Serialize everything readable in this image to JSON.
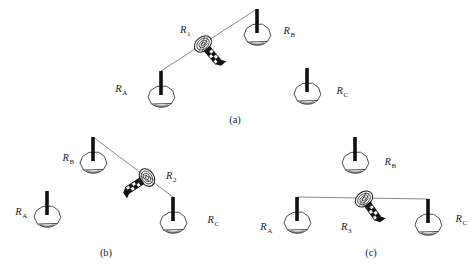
{
  "figure": {
    "background": "#ffffff",
    "link_color": "#6a6a6a",
    "ink_color": "#1a1a1a",
    "panels": [
      {
        "caption": "(a)",
        "relay_label": {
          "base": "R",
          "sub": "1"
        },
        "node_labels": {
          "a": {
            "base": "R",
            "sub": "A"
          },
          "b": {
            "base": "R",
            "sub": "B"
          },
          "c": {
            "base": "R",
            "sub": "C"
          }
        },
        "link": "RA connected to RB through relay R1; RC idle"
      },
      {
        "caption": "(b)",
        "relay_label": {
          "base": "R",
          "sub": "2"
        },
        "node_labels": {
          "a": {
            "base": "R",
            "sub": "A"
          },
          "b": {
            "base": "R",
            "sub": "B"
          },
          "c": {
            "base": "R",
            "sub": "C"
          }
        },
        "link": "RB connected to RC through relay R2; RA idle"
      },
      {
        "caption": "(c)",
        "relay_label": {
          "base": "R",
          "sub": "3"
        },
        "node_labels": {
          "a": {
            "base": "R",
            "sub": "A"
          },
          "b": {
            "base": "R",
            "sub": "B"
          },
          "c": {
            "base": "R",
            "sub": "C"
          }
        },
        "link": "RA connected to RC through relay R3; RB idle"
      }
    ]
  }
}
